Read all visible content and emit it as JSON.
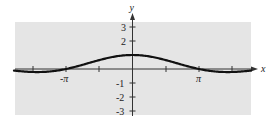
{
  "chart_data": {
    "type": "line",
    "title": "",
    "xlabel": "x",
    "ylabel": "y",
    "function_hint": "y = sin(x)/x",
    "xlim": [
      -5.6,
      5.6
    ],
    "ylim": [
      -3.3,
      3.5
    ],
    "grid": false,
    "legend": null,
    "x_ticks": [
      -4.712,
      -3.1416,
      -1.5708,
      0,
      1.5708,
      3.1416,
      4.712
    ],
    "x_tick_labels": [
      {
        "value": -3.1416,
        "label": "-π"
      },
      {
        "value": 3.1416,
        "label": "π"
      }
    ],
    "y_ticks": [
      -3,
      -2,
      -1,
      1,
      2,
      3
    ],
    "y_tick_labels": [
      "-3",
      "-2",
      "-1",
      "",
      "2",
      "3"
    ],
    "series": [
      {
        "name": "curve",
        "x": [
          -5.6,
          -5.0,
          -4.49,
          -4.0,
          -3.1416,
          -2.5,
          -2.0,
          -1.5,
          -1.0,
          -0.5,
          0,
          0.5,
          1.0,
          1.5,
          2.0,
          2.5,
          3.1416,
          4.0,
          4.49,
          5.0,
          5.6
        ],
        "y": [
          -0.113,
          -0.192,
          -0.217,
          -0.189,
          0.0,
          0.239,
          0.455,
          0.665,
          0.841,
          0.959,
          1.0,
          0.959,
          0.841,
          0.665,
          0.455,
          0.239,
          0.0,
          -0.189,
          -0.217,
          -0.192,
          -0.113
        ]
      }
    ]
  },
  "labels": {
    "x_axis": "x",
    "y_axis": "y",
    "neg_pi": "-π",
    "pos_pi": "π",
    "y3": "3",
    "y2": "2",
    "ym1": "-1",
    "ym2": "-2",
    "ym3": "-3"
  },
  "colors": {
    "panel": "#e5e5e5",
    "curve": "#111111",
    "axis": "#333333"
  }
}
